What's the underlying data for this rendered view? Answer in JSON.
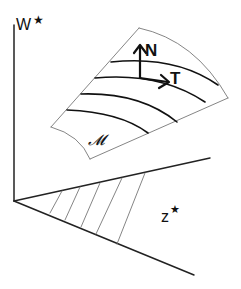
{
  "diagram": {
    "axes": {
      "vertical_label": "W",
      "vertical_label_sup": "★",
      "plane_label": "z",
      "plane_label_sup": "★"
    },
    "manifold": {
      "label": "𝓜",
      "level_curve_count": 4
    },
    "vectors": {
      "normal_label": "N",
      "tangent_label": "T"
    },
    "hatch_line_count": 5,
    "colors": {
      "axis": "#222222",
      "thin_edge": "#777777",
      "curve": "#111111",
      "background": "#ffffff"
    }
  }
}
